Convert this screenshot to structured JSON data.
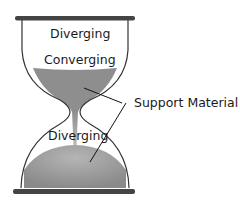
{
  "labels": {
    "top_diverging": "Diverging",
    "converging": "Converging",
    "support_material": "Support Material",
    "bottom_diverging": "Diverging"
  },
  "colors": {
    "bar": "#444444",
    "outline": "#333333",
    "fill": "#8c8c8c"
  }
}
